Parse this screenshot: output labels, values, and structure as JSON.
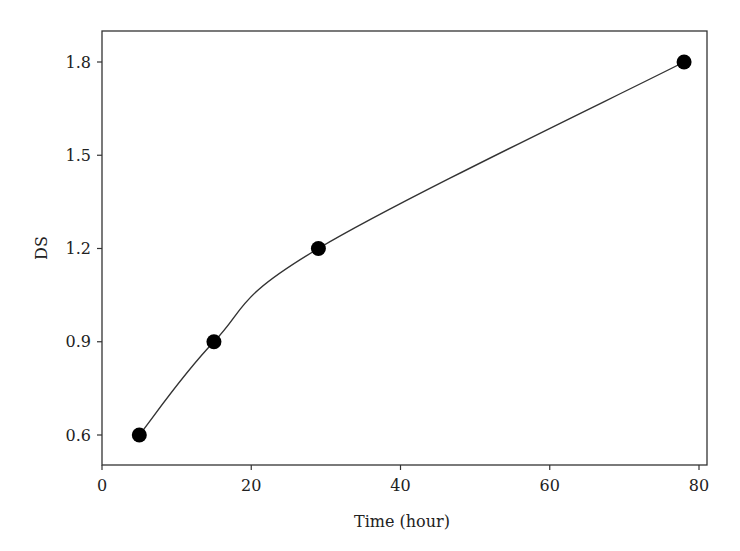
{
  "chart_data": {
    "type": "line",
    "title": "",
    "xlabel": "Time (hour)",
    "ylabel": "DS",
    "xlim": [
      0,
      81
    ],
    "ylim": [
      0.5,
      1.9
    ],
    "xticks": [
      0,
      20,
      40,
      60,
      80
    ],
    "xtick_labels": [
      "0",
      "20",
      "40",
      "60",
      "80"
    ],
    "yticks": [
      0.6,
      0.9,
      1.2,
      1.5,
      1.8
    ],
    "ytick_labels": [
      "0.6",
      "0.9",
      "1.2",
      "1.5",
      "1.8"
    ],
    "grid": false,
    "legend": null,
    "series": [
      {
        "name": "DS",
        "marker": "filled-circle",
        "line": "smooth",
        "color": "#000000",
        "x": [
          5,
          15,
          29,
          78
        ],
        "y": [
          0.6,
          0.9,
          1.2,
          1.8
        ]
      }
    ]
  }
}
